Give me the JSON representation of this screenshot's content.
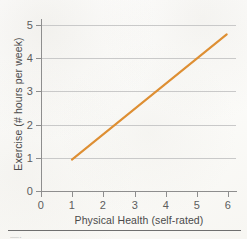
{
  "chart_data": {
    "type": "line",
    "title": "",
    "subtitle": "",
    "xlabel": "Physical Health (self-rated)",
    "ylabel": "Exercise (# hours per week)",
    "xlim": [
      0,
      6.3
    ],
    "ylim": [
      0,
      5.3
    ],
    "x_ticks": [
      "0",
      "1",
      "2",
      "3",
      "4",
      "5",
      "6"
    ],
    "y_ticks": [
      "0",
      "1",
      "2",
      "3",
      "4",
      "5"
    ],
    "x_tick_values": [
      0,
      1,
      2,
      3,
      4,
      5,
      6
    ],
    "y_tick_values": [
      0,
      1,
      2,
      3,
      4,
      5
    ],
    "grid": "horizontal",
    "legend": "none",
    "annotations": [],
    "series": [
      {
        "name": "Exercise vs Physical Health",
        "color": "#de8f33",
        "x": [
          1,
          6
        ],
        "values": [
          1,
          5
        ],
        "points": [
          {
            "x": 1,
            "y": 1
          },
          {
            "x": 6,
            "y": 5
          }
        ]
      }
    ]
  },
  "axes": {
    "axis_color": "#8e8e8e",
    "grid_color": "#c9c9c9",
    "tick_label_color": "#5d5d5d",
    "axis_title_color": "#4a4a4a"
  },
  "figure": {
    "background": "#fdfdfb",
    "caption_fragment": "—·",
    "rule_color": "#6f6f6f"
  }
}
